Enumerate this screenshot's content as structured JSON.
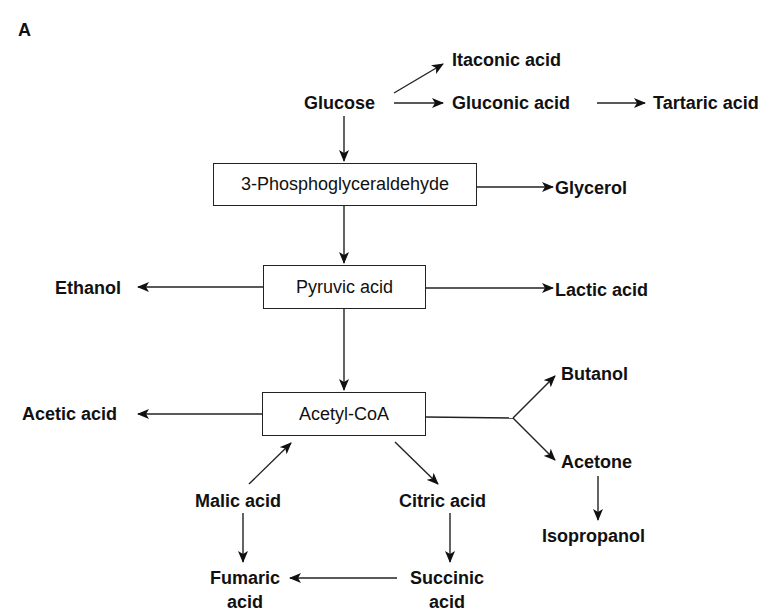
{
  "panel_label": "A",
  "boxes": {
    "phosphoglyceraldehyde": "3-Phosphoglyceraldehyde",
    "pyruvic": "Pyruvic acid",
    "acetylcoa": "Acetyl-CoA"
  },
  "products": {
    "glucose": "Glucose",
    "itaconic": "Itaconic acid",
    "gluconic": "Gluconic acid",
    "tartaric": "Tartaric acid",
    "glycerol": "Glycerol",
    "ethanol": "Ethanol",
    "lactic": "Lactic acid",
    "acetic": "Acetic acid",
    "butanol": "Butanol",
    "acetone": "Acetone",
    "isopropanol": "Isopropanol",
    "malic": "Malic acid",
    "citric": "Citric acid",
    "fumaric_1": "Fumaric",
    "fumaric_2": "acid",
    "succinic_1": "Succinic",
    "succinic_2": "acid"
  },
  "edges": [
    {
      "from": "Glucose",
      "to": "Itaconic acid"
    },
    {
      "from": "Glucose",
      "to": "Gluconic acid"
    },
    {
      "from": "Gluconic acid",
      "to": "Tartaric acid"
    },
    {
      "from": "Glucose",
      "to": "3-Phosphoglyceraldehyde"
    },
    {
      "from": "3-Phosphoglyceraldehyde",
      "to": "Glycerol"
    },
    {
      "from": "3-Phosphoglyceraldehyde",
      "to": "Pyruvic acid"
    },
    {
      "from": "Pyruvic acid",
      "to": "Ethanol"
    },
    {
      "from": "Pyruvic acid",
      "to": "Lactic acid"
    },
    {
      "from": "Pyruvic acid",
      "to": "Acetyl-CoA"
    },
    {
      "from": "Acetyl-CoA",
      "to": "Acetic acid"
    },
    {
      "from": "Acetyl-CoA",
      "to": "Butanol"
    },
    {
      "from": "Acetyl-CoA",
      "to": "Acetone"
    },
    {
      "from": "Acetone",
      "to": "Isopropanol"
    },
    {
      "from": "Acetyl-CoA",
      "to": "Citric acid"
    },
    {
      "from": "Citric acid",
      "to": "Succinic acid"
    },
    {
      "from": "Succinic acid",
      "to": "Fumaric acid"
    },
    {
      "from": "Malic acid",
      "to": "Fumaric acid"
    },
    {
      "from": "Malic acid",
      "to": "Acetyl-CoA"
    }
  ]
}
